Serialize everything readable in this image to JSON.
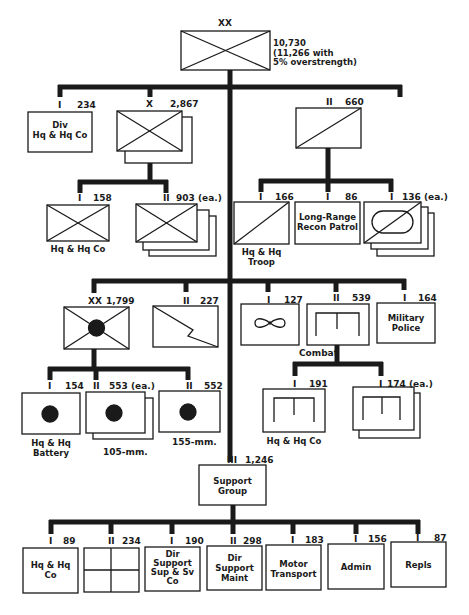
{
  "division": {
    "echelon": "XX",
    "strength": "10,730",
    "note_line1": "(11,266 with",
    "note_line2": "5% overstrength)"
  },
  "div_hq": {
    "echelon": "I",
    "strength": "234",
    "label_line1": "Div",
    "label_line2": "Hq & Hq Co"
  },
  "brigade": {
    "echelon": "X",
    "strength": "2,867"
  },
  "brigade_hq": {
    "echelon": "I",
    "strength": "158",
    "label": "Hq & Hq Co"
  },
  "infantry_bn": {
    "echelon": "II",
    "strength": "903 (ea.)"
  },
  "cavalry": {
    "echelon": "II",
    "strength": "660"
  },
  "cav_troop": {
    "echelon": "I",
    "strength": "166",
    "label_line1": "Hq & Hq",
    "label_line2": "Troop"
  },
  "lrrp": {
    "echelon": "I",
    "strength": "86",
    "label_line1": "Long-Range",
    "label_line2": "Recon Patrol"
  },
  "armored_cav": {
    "echelon": "I",
    "strength": "136 (ea.)"
  },
  "artillery": {
    "echelon": "XX",
    "strength": "1,799"
  },
  "signal": {
    "echelon": "II",
    "strength": "227"
  },
  "aviation": {
    "echelon": "I",
    "strength": "127"
  },
  "engineer": {
    "echelon": "II",
    "strength": "539",
    "label": "Combat"
  },
  "mp": {
    "echelon": "I",
    "strength": "164",
    "label_line1": "Military",
    "label_line2": "Police"
  },
  "arty_hq": {
    "echelon": "I",
    "strength": "154",
    "label_line1": "Hq & Hq",
    "label_line2": "Battery"
  },
  "arty_105": {
    "echelon": "II",
    "strength": "553 (ea.)",
    "label": "105-mm."
  },
  "arty_155": {
    "echelon": "II",
    "strength": "552",
    "label": "155-mm."
  },
  "eng_hq": {
    "echelon": "I",
    "strength": "191",
    "label": "Hq & Hq Co"
  },
  "eng_co": {
    "echelon": "I",
    "strength": "174 (ea.)"
  },
  "support": {
    "echelon": "III",
    "strength": "1,246",
    "label_line1": "Support",
    "label_line2": "Group"
  },
  "sup_units": [
    {
      "echelon": "I",
      "strength": "89",
      "lines": [
        "Hq & Hq",
        "Co"
      ]
    },
    {
      "echelon": "II",
      "strength": "234",
      "lines": []
    },
    {
      "echelon": "I",
      "strength": "190",
      "lines": [
        "Dir",
        "Support",
        "Sup & Sv",
        "Co"
      ]
    },
    {
      "echelon": "II",
      "strength": "298",
      "lines": [
        "Dir",
        "Support",
        "Maint"
      ]
    },
    {
      "echelon": "I",
      "strength": "183",
      "lines": [
        "Motor",
        "Transport"
      ]
    },
    {
      "echelon": "I",
      "strength": "156",
      "lines": [
        "Admin"
      ]
    },
    {
      "echelon": "I",
      "strength": "87",
      "lines": [
        "Repls"
      ]
    }
  ]
}
